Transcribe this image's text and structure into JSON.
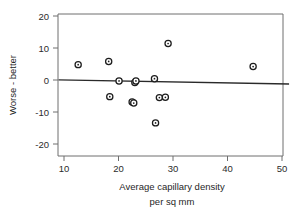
{
  "chart_data": {
    "type": "scatter",
    "title": "",
    "xlabel": "Average capillary density per sq mm",
    "xlabel_line1": "Average capillary density",
    "xlabel_line2": "per sq mm",
    "ylabel": "Worse - better",
    "xlim": [
      9.0,
      51.3
    ],
    "ylim": [
      -24.4,
      22.0
    ],
    "xticks": [
      10,
      20,
      30,
      40,
      50
    ],
    "xtick_labels": [
      "10",
      "20",
      "30",
      "40",
      "50"
    ],
    "yticks": [
      20,
      10,
      0,
      -10,
      -20
    ],
    "ytick_labels": [
      "20",
      "10",
      "0",
      "-10",
      "-20"
    ],
    "grid": false,
    "legend": false,
    "marker_style": "open-circle",
    "reference_line": {
      "type": "fitted-line",
      "x_start": 9.0,
      "y_start": 0.05,
      "x_end": 51.3,
      "y_end": -1.25,
      "color": "#2a2a2a"
    },
    "points": [
      {
        "x": 12.6,
        "y": 4.8
      },
      {
        "x": 18.2,
        "y": 5.8
      },
      {
        "x": 18.4,
        "y": -5.2
      },
      {
        "x": 20.1,
        "y": -0.3
      },
      {
        "x": 22.5,
        "y": -6.9
      },
      {
        "x": 22.8,
        "y": -7.2
      },
      {
        "x": 23.0,
        "y": -0.8
      },
      {
        "x": 23.2,
        "y": -0.3
      },
      {
        "x": 26.6,
        "y": 0.4
      },
      {
        "x": 26.8,
        "y": -13.4
      },
      {
        "x": 27.5,
        "y": -5.5
      },
      {
        "x": 28.6,
        "y": -5.4
      },
      {
        "x": 29.1,
        "y": 11.4
      },
      {
        "x": 44.7,
        "y": 4.2
      }
    ],
    "n_points": 14,
    "colors": {
      "marker_edge": "#1c1c1c",
      "marker_face": "#ffffff",
      "axis": "#6e6e6e",
      "reference_line": "#2a2a2a",
      "text": "#1f1f1f",
      "background": "#ffffff"
    }
  }
}
